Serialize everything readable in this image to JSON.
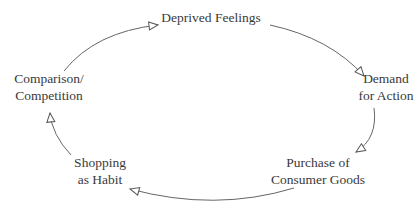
{
  "diagram": {
    "type": "cycle",
    "colors": {
      "text": "#3a3a3a",
      "arrow": "#555555",
      "background": "#ffffff"
    },
    "nodes": [
      {
        "id": "deprived",
        "lines": [
          "Deprived Feelings"
        ]
      },
      {
        "id": "demand",
        "lines": [
          "Demand",
          "for Action"
        ]
      },
      {
        "id": "purchase",
        "lines": [
          "Purchase of",
          "Consumer Goods"
        ]
      },
      {
        "id": "shopping",
        "lines": [
          "Shopping",
          "as Habit"
        ]
      },
      {
        "id": "comparison",
        "lines": [
          "Comparison/",
          "Competition"
        ]
      }
    ],
    "edges": [
      {
        "from": "deprived",
        "to": "demand"
      },
      {
        "from": "demand",
        "to": "purchase"
      },
      {
        "from": "purchase",
        "to": "shopping"
      },
      {
        "from": "shopping",
        "to": "comparison"
      },
      {
        "from": "comparison",
        "to": "deprived"
      }
    ]
  }
}
